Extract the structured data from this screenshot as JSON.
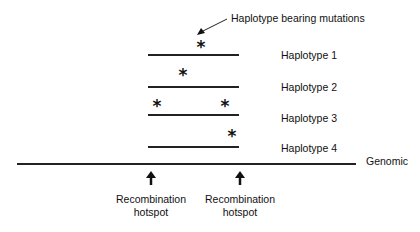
{
  "annotation": {
    "text": "Haplotype bearing mutations"
  },
  "haplotypes": [
    {
      "label": "Haplotype 1",
      "mutations": 1
    },
    {
      "label": "Haplotype 2",
      "mutations": 1
    },
    {
      "label": "Haplotype 3",
      "mutations": 2
    },
    {
      "label": "Haplotype 4",
      "mutations": 1
    }
  ],
  "mutation_symbol": "*",
  "genomic": {
    "label": "Genomic"
  },
  "hotspots": [
    {
      "line1": "Recombination",
      "line2": "hotspot"
    },
    {
      "line1": "Recombination",
      "line2": "hotspot"
    }
  ]
}
